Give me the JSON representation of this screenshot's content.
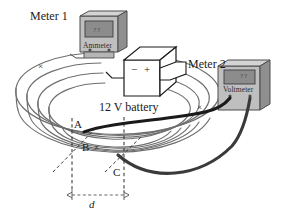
{
  "figure": {
    "background_color": "#ffffff"
  },
  "meters": {
    "meter1": {
      "caption": "Meter 1",
      "device_label": "Ammeter",
      "readout": "??",
      "body_color": "#bfbfbf",
      "screen_color": "#8c8c8c",
      "terminal_minus": "–",
      "terminal_plus": "+"
    },
    "meter2": {
      "caption": "Meter 2",
      "device_label": "Voltmeter",
      "readout": "??",
      "body_color": "#bfbfbf",
      "screen_color": "#8c8c8c",
      "terminal_minus": "–",
      "terminal_plus": "+"
    }
  },
  "battery": {
    "label": "12 V battery",
    "terminal_negative": "−",
    "terminal_positive": "+",
    "body_color": "#ffffff",
    "edge_color": "#1a1a1a"
  },
  "coil": {
    "description": "helical spiral coil of wire",
    "wire_color": "#6e6e6e",
    "field_marks": [
      {
        "symbol": "×",
        "position": "upper-left"
      },
      {
        "symbol": "×",
        "position": "right"
      }
    ]
  },
  "points": {
    "A": "A",
    "B": "B",
    "B_mark": "×",
    "C": "C"
  },
  "dimension": {
    "label": "d",
    "style": "dashed with arrowheads"
  },
  "probes": {
    "wire_color": "#1a1a1a",
    "count": 2
  }
}
